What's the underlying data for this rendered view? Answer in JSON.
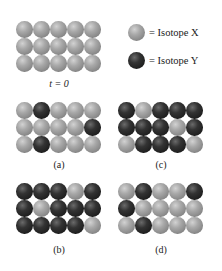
{
  "legend": {
    "items": [
      {
        "key": "X",
        "symbol": "=",
        "label": "Isotope X",
        "color": "#9a9a9a"
      },
      {
        "key": "Y",
        "symbol": "=",
        "label": "Isotope Y",
        "color": "#2a2a2a"
      }
    ]
  },
  "panels": [
    {
      "id": "t0",
      "label": "t = 0",
      "rows": [
        [
          "X",
          "X",
          "X",
          "X",
          "X"
        ],
        [
          "X",
          "X",
          "X",
          "X",
          "X"
        ],
        [
          "X",
          "X",
          "X",
          "X",
          "X"
        ]
      ]
    },
    {
      "id": "a",
      "label": "(a)",
      "rows": [
        [
          "X",
          "Y",
          "X",
          "X",
          "X"
        ],
        [
          "X",
          "X",
          "X",
          "X",
          "Y"
        ],
        [
          "X",
          "Y",
          "X",
          "X",
          "X"
        ]
      ]
    },
    {
      "id": "c",
      "label": "(c)",
      "rows": [
        [
          "Y",
          "X",
          "Y",
          "Y",
          "Y"
        ],
        [
          "Y",
          "Y",
          "Y",
          "X",
          "Y"
        ],
        [
          "X",
          "Y",
          "Y",
          "Y",
          "X"
        ]
      ]
    },
    {
      "id": "b",
      "label": "(b)",
      "rows": [
        [
          "Y",
          "Y",
          "Y",
          "X",
          "Y"
        ],
        [
          "Y",
          "X",
          "Y",
          "Y",
          "Y"
        ],
        [
          "Y",
          "Y",
          "Y",
          "Y",
          "X"
        ]
      ]
    },
    {
      "id": "d",
      "label": "(d)",
      "rows": [
        [
          "X",
          "Y",
          "X",
          "X",
          "Y"
        ],
        [
          "Y",
          "X",
          "X",
          "X",
          "X"
        ],
        [
          "X",
          "Y",
          "X",
          "X",
          "X"
        ]
      ]
    }
  ]
}
